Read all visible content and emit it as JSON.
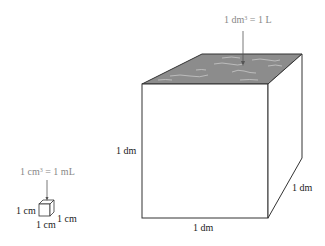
{
  "large_cube": {
    "volume_label_pre": "1 dm",
    "volume_label_exp": "3",
    "volume_label_post": " = 1 L",
    "edge_left": "1 dm",
    "edge_bottom": "1 dm",
    "edge_right": "1 dm",
    "top_fill_color": "#8c8c8c"
  },
  "small_cube": {
    "volume_label_pre": "1 cm",
    "volume_label_exp": "3",
    "volume_label_post": " = 1 mL",
    "edge_left": "1 cm",
    "edge_bottom": "1 cm",
    "edge_right": "1 cm"
  }
}
